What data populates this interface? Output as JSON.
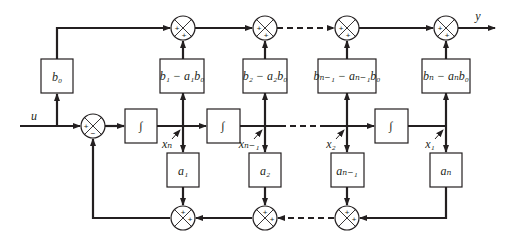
{
  "diagram": {
    "type": "controllable canonical form state-space block diagram",
    "input_label": "u",
    "output_label": "y",
    "feedforward_gain": "b₀",
    "top_gains": [
      "b₁ − a₁b₀",
      "b₂ − a₂b₀",
      "bₙ₋₁ − aₙ₋₁b₀",
      "bₙ − aₙb₀"
    ],
    "integrator_symbol": "∫",
    "state_labels": [
      "xₙ",
      "xₙ₋₁",
      "x₂",
      "x₁"
    ],
    "feedback_gains": [
      "a₁",
      "a₂",
      "aₙ₋₁",
      "aₙ"
    ],
    "input_summer_signs": [
      "+",
      "−"
    ],
    "summer_signs": [
      "+",
      "+"
    ]
  }
}
